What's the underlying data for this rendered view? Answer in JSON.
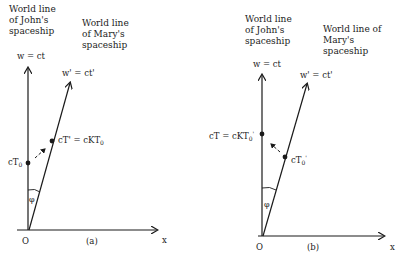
{
  "panels": {
    "a": {
      "caption": "(a)",
      "john_title_lines": [
        "World line",
        "of John's",
        "spaceship"
      ],
      "mary_title_lines": [
        "World line",
        "of Mary's",
        "spaceship"
      ],
      "w_axis_label": "w = ct",
      "w_prime_label": "w' = ct'",
      "origin_label": "O",
      "x_axis_label": "x",
      "angle_label": "φ",
      "event_john_label": {
        "base": "cT",
        "sub": "0"
      },
      "event_mary_label": {
        "lhs": "cT' = cKT",
        "sub": "0"
      }
    },
    "b": {
      "caption": "(b)",
      "john_title_lines": [
        "World line",
        "of John's",
        "spaceship"
      ],
      "mary_title_lines": [
        "World line of",
        "Mary's",
        "spaceship"
      ],
      "w_axis_label": "w = ct",
      "w_prime_label": "w' = ct'",
      "origin_label": "O",
      "x_axis_label": "x",
      "angle_label": "φ",
      "event_john_label": {
        "lhs": "cT = cKT",
        "sub": "0",
        "prime": "'"
      },
      "event_mary_label": {
        "base": "cT",
        "sub": "0",
        "prime": "'"
      }
    }
  },
  "colors": {
    "ink": "#1a1a1a",
    "background": "#ffffff"
  }
}
